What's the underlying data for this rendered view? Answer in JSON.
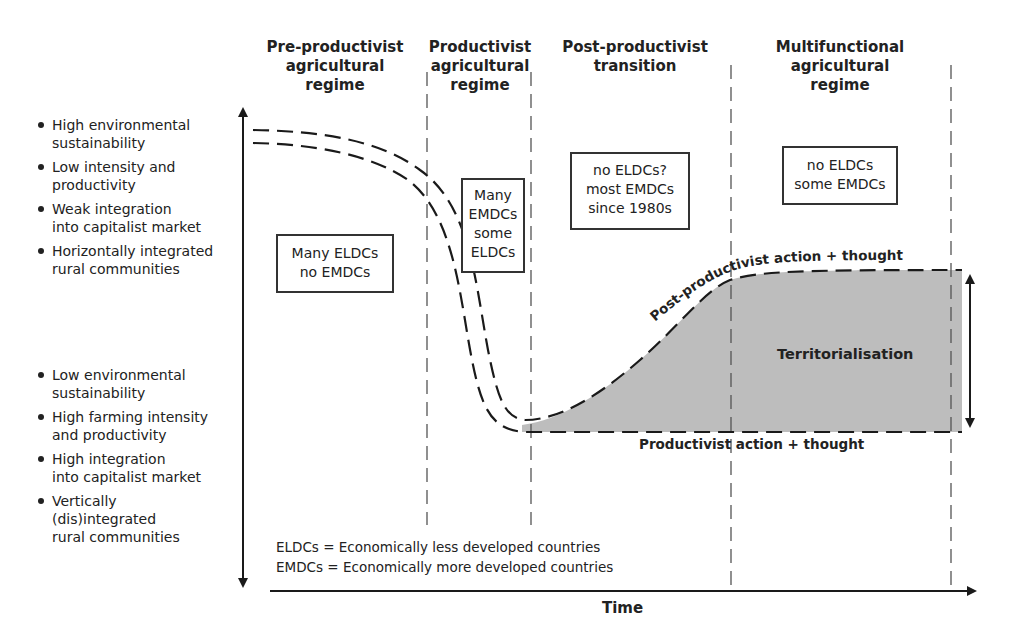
{
  "phases": [
    {
      "id": "pre-productivist",
      "label_lines": [
        "Pre-productivist",
        "agricultural",
        "regime"
      ]
    },
    {
      "id": "productivist",
      "label_lines": [
        "Productivist",
        "agricultural",
        "regime"
      ]
    },
    {
      "id": "post-productivist",
      "label_lines": [
        "Post-productivist",
        "transition"
      ]
    },
    {
      "id": "multifunctional",
      "label_lines": [
        "Multifunctional",
        "agricultural",
        "regime"
      ]
    }
  ],
  "y_axis": {
    "top_characteristics": [
      "High environmental sustainability",
      "Low intensity and productivity",
      "Weak integration into capitalist market",
      "Horizontally integrated rural communities"
    ],
    "top_lines": [
      [
        "High environmental",
        "sustainability"
      ],
      [
        "Low intensity and",
        "productivity"
      ],
      [
        "Weak integration",
        "into capitalist market"
      ],
      [
        "Horizontally integrated",
        "rural communities"
      ]
    ],
    "bottom_characteristics": [
      "Low environmental sustainability",
      "High farming intensity and productivity",
      "High integration into capitalist market",
      "Vertically (dis)integrated rural communities"
    ],
    "bottom_lines": [
      [
        "Low environmental",
        "sustainability"
      ],
      [
        "High farming intensity",
        "and productivity"
      ],
      [
        "High integration",
        "into capitalist market"
      ],
      [
        "Vertically",
        "(dis)integrated",
        "rural communities"
      ]
    ]
  },
  "x_axis": {
    "label": "Time"
  },
  "boxes": [
    {
      "phase": "pre-productivist",
      "lines": [
        "Many ELDCs",
        "no EMDCs"
      ]
    },
    {
      "phase": "productivist",
      "lines": [
        "Many",
        "EMDCs",
        "some",
        "ELDCs"
      ]
    },
    {
      "phase": "post-productivist",
      "lines": [
        "no ELDCs?",
        "most EMDCs",
        "since 1980s"
      ]
    },
    {
      "phase": "multifunctional",
      "lines": [
        "no ELDCs",
        "some EMDCs"
      ]
    }
  ],
  "curve_labels": {
    "upper": "Post-productivist action + thought",
    "lower": "Productivist action + thought",
    "area": "Territorialisation"
  },
  "legend": [
    {
      "abbr": "ELDCs",
      "sep": " = ",
      "meaning": "Economically less developed countries"
    },
    {
      "abbr": "EMDCs",
      "sep": " = ",
      "meaning": "Economically more developed countries"
    }
  ],
  "colors": {
    "line": "#1a1a1a",
    "fill": "#b8b8b8",
    "divider": "#555555"
  }
}
